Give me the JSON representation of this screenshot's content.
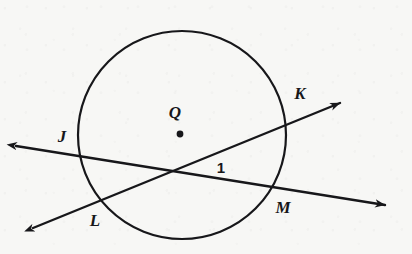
{
  "figure": {
    "type": "geometry-diagram",
    "background_color": "#f7f7f5",
    "ink_color": "#17171a",
    "width": 412,
    "height": 254
  },
  "circle": {
    "name": "circle-Q",
    "center_label": "Q",
    "center_x": 182,
    "center_y": 135,
    "radius": 104,
    "stroke_width": 2.2
  },
  "center_point": {
    "label": "Q",
    "dot_x": 180,
    "dot_y": 134,
    "dot_radius": 3.4,
    "label_x": 175,
    "label_y": 112
  },
  "intersection": {
    "name": "secant-intersection",
    "x": 171,
    "y": 172
  },
  "lines": [
    {
      "name": "secant-JM",
      "label": "JM",
      "from_label": "J",
      "to_label": "M",
      "x1": 16,
      "y1": 146,
      "x2": 385,
      "y2": 205,
      "arrow_start": true,
      "arrow_end": true,
      "stroke_width": 2.4
    },
    {
      "name": "secant-LK",
      "label": "LK",
      "from_label": "L",
      "to_label": "K",
      "x1": 33,
      "y1": 228,
      "x2": 340,
      "y2": 103,
      "arrow_start": true,
      "arrow_end": true,
      "stroke_width": 2.4
    }
  ],
  "labels": [
    {
      "id": "label-J",
      "text": "J",
      "x": 62,
      "y": 136,
      "style": "point"
    },
    {
      "id": "label-K",
      "text": "K",
      "x": 300,
      "y": 93,
      "style": "point"
    },
    {
      "id": "label-L",
      "text": "L",
      "x": 95,
      "y": 220,
      "style": "point"
    },
    {
      "id": "label-M",
      "text": "M",
      "x": 283,
      "y": 207,
      "style": "point"
    },
    {
      "id": "label-Q",
      "text": "Q",
      "x": 175,
      "y": 112,
      "style": "point"
    },
    {
      "id": "label-angle-1",
      "text": "1",
      "x": 221,
      "y": 167,
      "style": "angle"
    }
  ]
}
